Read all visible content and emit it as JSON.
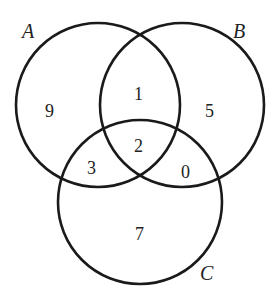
{
  "diagram": {
    "type": "venn-3-set",
    "sets": [
      {
        "label": "A"
      },
      {
        "label": "B"
      },
      {
        "label": "C"
      }
    ],
    "regions": {
      "A_only": "9",
      "B_only": "5",
      "C_only": "7",
      "A_and_B_only": "1",
      "A_and_C_only": "3",
      "B_and_C_only": "0",
      "A_and_B_and_C": "2"
    },
    "stroke_color": "#1a1a1a"
  }
}
